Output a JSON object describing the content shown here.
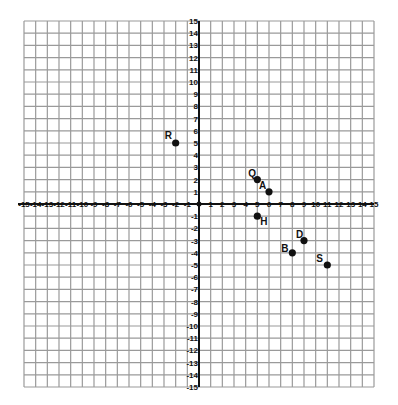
{
  "chart_data": {
    "type": "scatter",
    "title": "",
    "xlabel": "",
    "ylabel": "",
    "xlim": [
      -15,
      15
    ],
    "ylim": [
      -15,
      15
    ],
    "grid": true,
    "x_ticks": [
      -15,
      -14,
      -13,
      -12,
      -11,
      -10,
      -9,
      -8,
      -7,
      -6,
      -5,
      -4,
      -3,
      -2,
      -1,
      1,
      2,
      3,
      4,
      5,
      6,
      7,
      8,
      9,
      10,
      11,
      12,
      13,
      14,
      15
    ],
    "y_ticks": [
      -15,
      -14,
      -13,
      -12,
      -11,
      -10,
      -9,
      -8,
      -7,
      -6,
      -5,
      -4,
      -3,
      -2,
      -1,
      1,
      2,
      3,
      4,
      5,
      6,
      7,
      8,
      9,
      10,
      11,
      12,
      13,
      14,
      15
    ],
    "points": [
      {
        "label": "R",
        "x": -2,
        "y": 5,
        "label_dx": -11,
        "label_dy": -4
      },
      {
        "label": "Q",
        "x": 5,
        "y": 2,
        "label_dx": -9,
        "label_dy": -3
      },
      {
        "label": "A",
        "x": 6,
        "y": 1,
        "label_dx": -10,
        "label_dy": -3
      },
      {
        "label": "H",
        "x": 5,
        "y": -1,
        "label_dx": 3,
        "label_dy": 9
      },
      {
        "label": "D",
        "x": 9,
        "y": -3,
        "label_dx": -8,
        "label_dy": -3
      },
      {
        "label": "B",
        "x": 8,
        "y": -4,
        "label_dx": -11,
        "label_dy": -1
      },
      {
        "label": "S",
        "x": 11,
        "y": -5,
        "label_dx": -11,
        "label_dy": -3
      }
    ]
  },
  "style": {
    "grid_color": "#9a9a9a",
    "axis_color": "#111111",
    "point_color": "#111111"
  }
}
